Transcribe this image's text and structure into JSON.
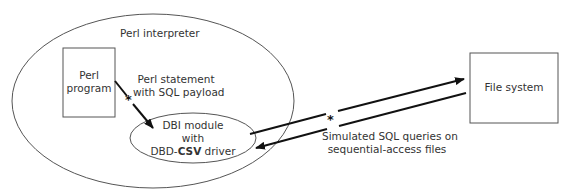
{
  "diagram": {
    "interpreter_label": "Perl interpreter",
    "program_box": {
      "line1": "Perl",
      "line2": "program"
    },
    "statement_label": {
      "line1": "Perl statement",
      "line2": "with SQL payload"
    },
    "dbi": {
      "line1": "DBI module",
      "line2": "with",
      "line3_prefix": "DBD-",
      "line3_bold": "CSV",
      "line3_suffix": " driver"
    },
    "file_system_label": "File system",
    "queries_label": {
      "line1": "Simulated SQL queries on",
      "line2": "sequential-access files"
    },
    "marker_glyph": "*",
    "stroke_color": "#222222",
    "outline_color": "#555555"
  }
}
